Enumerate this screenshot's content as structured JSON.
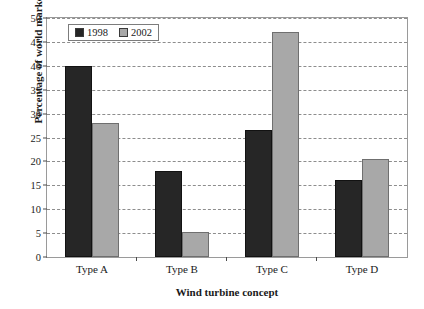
{
  "chart_data": {
    "type": "bar",
    "title": "",
    "xlabel": "Wind turbine concept",
    "ylabel": "Percentage of world market",
    "categories": [
      "Type A",
      "Type B",
      "Type C",
      "Type D"
    ],
    "series": [
      {
        "name": "1998",
        "color": "#262626",
        "values": [
          39.7,
          17.8,
          26.4,
          15.9
        ]
      },
      {
        "name": "2002",
        "color": "#a8a8a8",
        "values": [
          27.8,
          5.2,
          46.6,
          20.3
        ]
      }
    ],
    "ylim": [
      0,
      50
    ],
    "ytick_step": 5,
    "yticks": [
      "0",
      "5",
      "10",
      "15",
      "20",
      "25",
      "30",
      "35",
      "40",
      "45",
      "50"
    ],
    "grid": "horizontal-dashed",
    "legend_position": "top-left-inside"
  }
}
